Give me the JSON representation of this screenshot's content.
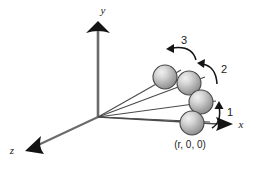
{
  "figure": {
    "background_color": "#ffffff"
  },
  "axes": {
    "stroke_color": "#5a5a5a",
    "arrow_color": "#1a1a1a",
    "items": [
      {
        "name": "y-axis",
        "label": "y",
        "direction": "up",
        "label_x": 103,
        "label_y": 14
      },
      {
        "name": "x-axis",
        "label": "x",
        "direction": "right",
        "label_x": 241,
        "label_y": 128
      },
      {
        "name": "z-axis",
        "label": "z",
        "direction": "down-left",
        "label_x": 12,
        "label_y": 154
      }
    ]
  },
  "spheres": {
    "fill_light": "#e8e8e8",
    "fill_mid": "#b4b4b4",
    "fill_dark": "#8a8a8a",
    "outline_color": "#4a4a4a",
    "items": [
      {
        "name": "sphere-position-4",
        "cx": 165,
        "cy": 77,
        "r": 12
      },
      {
        "name": "sphere-position-3",
        "cx": 189,
        "cy": 83,
        "r": 12
      },
      {
        "name": "sphere-position-2",
        "cx": 201,
        "cy": 102,
        "r": 12
      },
      {
        "name": "sphere-position-1",
        "cx": 192,
        "cy": 123,
        "r": 12
      }
    ]
  },
  "rotation_arrows": {
    "color": "#1a1a1a",
    "items": [
      {
        "name": "rotation-arrow-1",
        "label": "1",
        "label_x": 227,
        "label_y": 116
      },
      {
        "name": "rotation-arrow-2",
        "label": "2",
        "label_x": 221,
        "label_y": 73
      },
      {
        "name": "rotation-arrow-3",
        "label": "3",
        "label_x": 181,
        "label_y": 44
      }
    ]
  },
  "annotations": {
    "origin_point": {
      "x": 98,
      "y": 117
    },
    "coordinate_label": {
      "name": "coordinate-label",
      "text": "(r, 0, 0)",
      "x": 190,
      "y": 148
    }
  }
}
